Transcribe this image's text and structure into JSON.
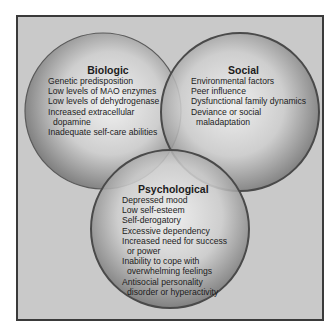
{
  "diagram": {
    "type": "venn",
    "colors": {
      "background": "#c9c9c9",
      "frame": "#3a3a3a",
      "circle_highlight": "#f4f4f4",
      "circle_shadow": "#6a6a6a",
      "circle_edge": "#4a4a4a",
      "text": "#1c1c1c"
    },
    "circles": [
      {
        "title": "Biologic",
        "items": [
          {
            "line1": "Genetic predisposition"
          },
          {
            "line1": "Low levels of MAO enzymes"
          },
          {
            "line1": "Low levels of dehydrogenase"
          },
          {
            "line1": "Increased extracellular",
            "line2": "dopamine"
          },
          {
            "line1": "Inadequate self-care abilities"
          }
        ]
      },
      {
        "title": "Social",
        "items": [
          {
            "line1": "Environmental factors"
          },
          {
            "line1": "Peer influence"
          },
          {
            "line1": "Dysfunctional family dynamics"
          },
          {
            "line1": "Deviance or social",
            "line2": "maladaptation"
          }
        ]
      },
      {
        "title": "Psychological",
        "items": [
          {
            "line1": "Depressed mood"
          },
          {
            "line1": "Low self-esteem"
          },
          {
            "line1": "Self-derogatory"
          },
          {
            "line1": "Excessive dependency"
          },
          {
            "line1": "Increased need for success",
            "line2": "or power"
          },
          {
            "line1": "Inability to cope with",
            "line2": "overwhelming feelings"
          },
          {
            "line1": "Antisocial personality",
            "line2": "disorder or hyperactivity"
          }
        ]
      }
    ]
  }
}
